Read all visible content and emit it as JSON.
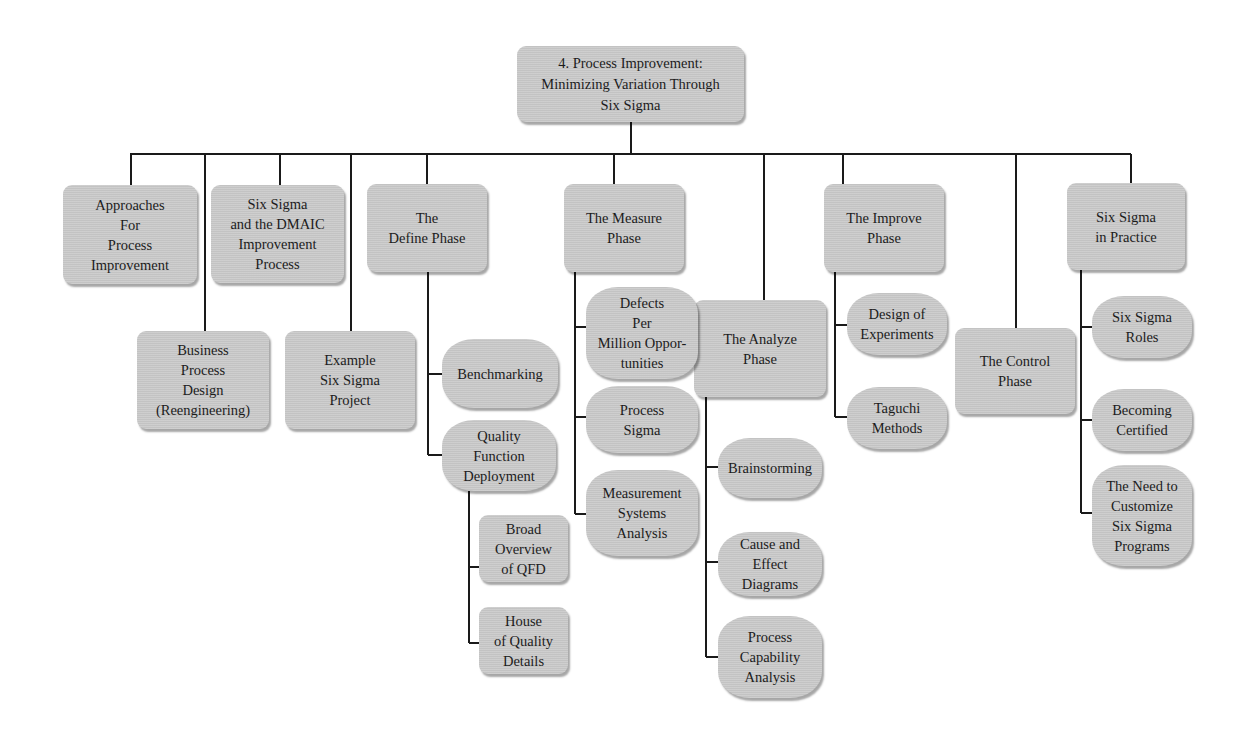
{
  "title": "4. Process Improvement:\nMinimizing Variation Through\nSix Sigma",
  "nodes": {
    "root": "4. Process Improvement:\nMinimizing Variation Through\nSix Sigma",
    "approaches": "Approaches\nFor\nProcess\nImprovement",
    "business_process_design": "Business\nProcess\nDesign\n(Reengineering)",
    "dmaic": "Six Sigma\nand the DMAIC\nImprovement\nProcess",
    "example_project": "Example\nSix Sigma\nProject",
    "define_phase": "The\nDefine Phase",
    "benchmarking": "Benchmarking",
    "qfd": "Quality\nFunction\nDeployment",
    "qfd_overview": "Broad\nOverview\nof QFD",
    "house_of_quality": "House\nof Quality\nDetails",
    "measure_phase": "The Measure\nPhase",
    "dpmo": "Defects\nPer\nMillion Oppor-\ntunities",
    "process_sigma": "Process\nSigma",
    "msa": "Measurement\nSystems\nAnalysis",
    "analyze_phase": "The Analyze\nPhase",
    "brainstorming": "Brainstorming",
    "cause_effect": "Cause and\nEffect\nDiagrams",
    "process_capability": "Process\nCapability\nAnalysis",
    "improve_phase": "The Improve\nPhase",
    "doe": "Design of\nExperiments",
    "taguchi": "Taguchi\nMethods",
    "control_phase": "The Control\nPhase",
    "in_practice": "Six Sigma\nin Practice",
    "roles": "Six Sigma\nRoles",
    "certified": "Becoming\nCertified",
    "customize": "The Need to\nCustomize\nSix Sigma\nPrograms"
  },
  "hierarchy": {
    "root": [
      "approaches",
      "business_process_design",
      "dmaic",
      "example_project",
      "define_phase",
      "measure_phase",
      "analyze_phase",
      "improve_phase",
      "control_phase",
      "in_practice"
    ],
    "define_phase": [
      "benchmarking",
      "qfd"
    ],
    "qfd": [
      "qfd_overview",
      "house_of_quality"
    ],
    "measure_phase": [
      "dpmo",
      "process_sigma",
      "msa"
    ],
    "analyze_phase": [
      "brainstorming",
      "cause_effect",
      "process_capability"
    ],
    "improve_phase": [
      "doe",
      "taguchi"
    ],
    "in_practice": [
      "roles",
      "certified",
      "customize"
    ]
  },
  "colors": {
    "node_fill": "#c9c9c9",
    "line": "#1a1a1a",
    "text": "#1c1c1c",
    "background": "#ffffff"
  }
}
